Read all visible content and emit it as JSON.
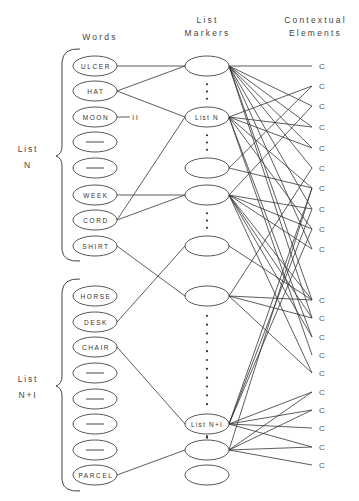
{
  "headers": {
    "words": "Words",
    "list_markers": [
      "List",
      "Markers"
    ],
    "contextual_elements": [
      "Contextual",
      "Elements"
    ]
  },
  "list_labels": [
    {
      "line1": "List",
      "line2": "N"
    },
    {
      "line1": "List",
      "line2": "N+I"
    }
  ],
  "words": [
    {
      "text": "ULCER",
      "y": 66
    },
    {
      "text": "HAT",
      "y": 91
    },
    {
      "text": "MOON",
      "y": 117
    },
    {
      "text": "—",
      "y": 142
    },
    {
      "text": "—",
      "y": 168
    },
    {
      "text": "WEEK",
      "y": 195
    },
    {
      "text": "CORD",
      "y": 220
    },
    {
      "text": "SHIRT",
      "y": 246
    },
    {
      "text": "HORSE",
      "y": 296
    },
    {
      "text": "DESK",
      "y": 322
    },
    {
      "text": "CHAIR",
      "y": 347
    },
    {
      "text": "—",
      "y": 373
    },
    {
      "text": "—",
      "y": 399
    },
    {
      "text": "—",
      "y": 424
    },
    {
      "text": "—",
      "y": 450
    },
    {
      "text": "PARCEL",
      "y": 475
    }
  ],
  "moon_annotation": "II",
  "markers": [
    {
      "text": "",
      "y": 66
    },
    {
      "text": "List N",
      "y": 117
    },
    {
      "text": "",
      "y": 168
    },
    {
      "text": "",
      "y": 195
    },
    {
      "text": "",
      "y": 246
    },
    {
      "text": "",
      "y": 296
    },
    {
      "text": "List N+I",
      "y": 424
    },
    {
      "text": "",
      "y": 450
    },
    {
      "text": "",
      "y": 475
    }
  ],
  "contextual_elements": {
    "label": "C",
    "ys": [
      66,
      86,
      106,
      127,
      148,
      168,
      188,
      209,
      229,
      249,
      300,
      318,
      337,
      355,
      373,
      392,
      410,
      428,
      447,
      465
    ]
  },
  "word_marker_links": [
    [
      0,
      0
    ],
    [
      1,
      0
    ],
    [
      1,
      1
    ],
    [
      5,
      3
    ],
    [
      6,
      1
    ],
    [
      6,
      3
    ],
    [
      7,
      5
    ],
    [
      9,
      4
    ],
    [
      10,
      6
    ],
    [
      15,
      7
    ]
  ],
  "marker_context_links": {
    "0": [
      0,
      2,
      3,
      4,
      5,
      7,
      9,
      10,
      11
    ],
    "1": [
      1,
      3,
      4,
      6,
      8,
      12,
      13
    ],
    "2": [
      1,
      6
    ],
    "3": [
      2,
      7,
      8,
      9,
      10,
      11,
      12,
      14
    ],
    "4": [
      10
    ],
    "5": [
      5,
      10,
      11,
      14
    ],
    "6": [
      6,
      7,
      8,
      15,
      16,
      17,
      18
    ],
    "7": [
      6,
      15,
      16,
      18,
      19
    ]
  }
}
